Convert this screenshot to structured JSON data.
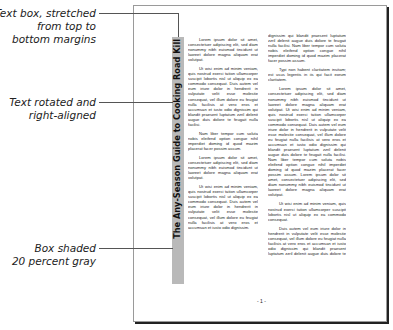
{
  "callouts": [
    {
      "lines": [
        "Text box, stretched",
        "from top to",
        "bottom margins"
      ]
    },
    {
      "lines": [
        "Text rotated and",
        "right-aligned"
      ]
    },
    {
      "lines": [
        "Box shaded",
        "20 percent gray"
      ]
    }
  ],
  "page": {
    "sidebar_title": "The Any-Season Guide to Cooking Road Kill",
    "sidebar_shade": "#b9b9b9",
    "page_number": "- 1 -",
    "column1": [
      "Lorem ipsum dolor sit amet, consectetuer adipiscing elit, sed diam nonummy nibh euismod tincidunt ut laoreet dolore magna aliquam erat volutpat.",
      "Ut wisi enim ad minim veniam, quis nostrud exerci tation ullamcorper suscipit lobortis nisl ut aliquip ex ea commodo consequat. Duis autem vel eum iriure dolor in hendrerit in vulputate velit esse molestie consequat, vel illum dolore eu feugiat nulla facilisis at vero eros et accumsan et iusto odio dignissim qui blandit praesent luptatum zzril delenit augue duis dolore te feugait nulla facilisi.",
      "Nam liber tempor cum soluta nobis eleifend option congue nihil imperdiet doming id quod mazim placerat facer possim assum.",
      "Lorem ipsum dolor sit amet, consectetuer adipiscing elit, sed diam nonummy nibh euismod tincidunt ut laoreet dolore magna aliquam erat volutpat.",
      "Ut wisi enim ad minim veniam, quis nostrud exerci tation ullamcorper suscipit lobortis nisl ut aliquip ex ea commodo consequat. Duis autem vel eum iriure dolor in hendrerit in vulputate velit esse molestie consequat, vel illum dolore eu feugiat nulla facilisis at vero eros et accumsan et iusto odio dignissim."
    ],
    "column2": [
      "dignissim qui blandit praesent luptatum zzril delenit augue duis dolore te feugait nulla facilisi. Nam liber tempor cum soluta nobis eleifend option congue nihil imperdiet doming id quod mazim placerat facer possim assum.",
      "Typi non habent claritatem insitam; est usus legentis in iis qui facit eorum claritatem.",
      "Lorem ipsum dolor sit amet, consectetuer adipiscing elit, sed diam nonummy nibh euismod tincidunt ut laoreet dolore magna aliquam erat volutpat. Ut wisi enim ad minim veniam, quis nostrud exerci tation ullamcorper suscipit lobortis nisl ut aliquip ex ea commodo consequat. Duis autem vel eum iriure dolor in hendrerit in vulputate velit esse molestie consequat, vel illum dolore eu feugiat nulla facilisis at vero eros et accumsan et iusto odio dignissim qui blandit praesent luptatum zzril delenit augue duis dolore te feugait nulla facilisi. Nam liber tempor cum soluta nobis eleifend option congue nihil imperdiet doming id quod mazim placerat facer possim assum. Lorem ipsum dolor sit amet, consectetuer adipiscing elit, sed diam nonummy nibh euismod tincidunt ut laoreet dolore magna aliquam erat volutpat.",
      "Ut wisi enim ad minim veniam, quis nostrud exerci tation ullamcorper suscipit lobortis nisl ut aliquip ex ea commodo consequat.",
      "Duis autem vel eum iriure dolor in hendrerit in vulputate velit esse molestie consequat, vel illum dolore eu feugiat nulla facilisis at vero eros et accumsan et iusto odio dignissim qui blandit praesent luptatum zzril delenit augue duis dolore te feugait nulla facilisi.",
      "Nam liber tempor cum soluta nobis eleifend option congue nihil imperdiet doming id quod mazim placerat facer possim assum."
    ]
  }
}
